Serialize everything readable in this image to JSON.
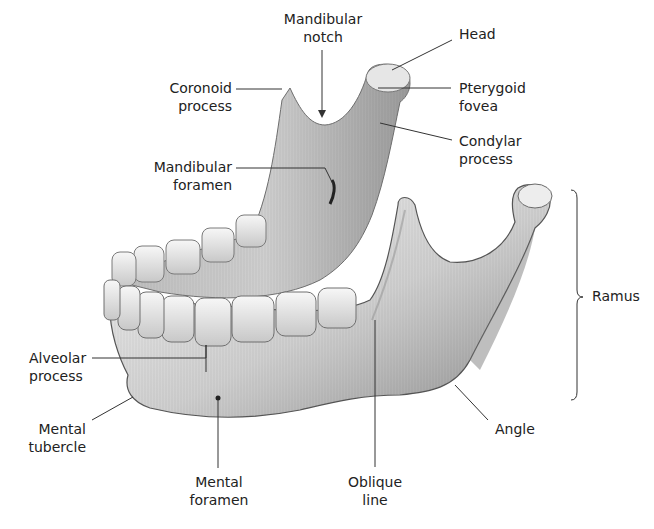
{
  "diagram": {
    "colors": {
      "bone": "#d9d9d9",
      "bone_shadow": "#8a8a8a",
      "bone_highlight": "#f4f4f4",
      "leader": "#333333",
      "text": "#222222"
    },
    "labels": {
      "mandibular_notch": {
        "line1": "Mandibular",
        "line2": "notch"
      },
      "head": {
        "line1": "Head"
      },
      "coronoid_process": {
        "line1": "Coronoid",
        "line2": "process"
      },
      "pterygoid_fovea": {
        "line1": "Pterygoid",
        "line2": "fovea"
      },
      "condylar_process": {
        "line1": "Condylar",
        "line2": "process"
      },
      "mandibular_foramen": {
        "line1": "Mandibular",
        "line2": "foramen"
      },
      "ramus": {
        "line1": "Ramus"
      },
      "alveolar_process": {
        "line1": "Alveolar",
        "line2": "process"
      },
      "mental_tubercle": {
        "line1": "Mental",
        "line2": "tubercle"
      },
      "angle": {
        "line1": "Angle"
      },
      "mental_foramen": {
        "line1": "Mental",
        "line2": "foramen"
      },
      "oblique_line": {
        "line1": "Oblique",
        "line2": "line"
      }
    }
  }
}
